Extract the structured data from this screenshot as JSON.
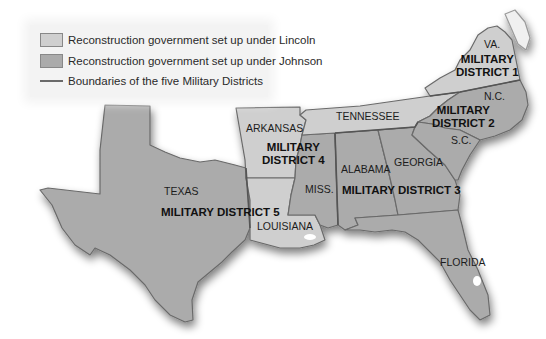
{
  "legend": {
    "items": [
      {
        "label": "Reconstruction government set up under Lincoln",
        "type": "swatch",
        "color": "#cfcfcf"
      },
      {
        "label": "Reconstruction government set up under Johnson",
        "type": "swatch",
        "color": "#ababab"
      },
      {
        "label": "Boundaries of the five Military Districts",
        "type": "line",
        "color": "#6a6a6a"
      }
    ]
  },
  "colors": {
    "lincoln": "#cfcfcf",
    "johnson": "#ababab",
    "boundary": "#6a6a6a",
    "background": "#ffffff"
  },
  "states": {
    "virginia": "VA.",
    "north_carolina": "N.C.",
    "south_carolina": "S.C.",
    "tennessee": "TENNESSEE",
    "arkansas": "ARKANSAS",
    "mississippi": "MISS.",
    "alabama": "ALABAMA",
    "georgia": "GEORGIA",
    "texas": "TEXAS",
    "louisiana": "LOUISIANA",
    "florida": "FLORIDA"
  },
  "districts": {
    "d1_line1": "MILITARY",
    "d1_line2": "DISTRICT 1",
    "d2_line1": "MILITARY",
    "d2_line2": "DISTRICT 2",
    "d3": "MILITARY DISTRICT 3",
    "d4_line1": "MILITARY",
    "d4_line2": "DISTRICT 4",
    "d5": "MILITARY DISTRICT 5"
  }
}
